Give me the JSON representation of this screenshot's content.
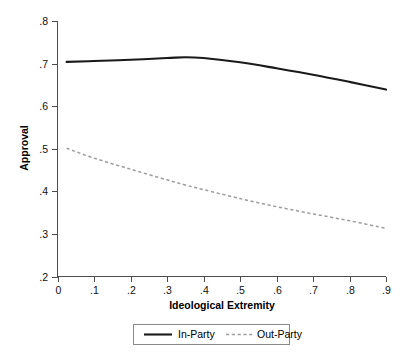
{
  "chart_data": {
    "type": "line",
    "title": "",
    "xlabel": "Ideological Extremity",
    "ylabel": "Approval",
    "xlim": [
      0,
      0.9
    ],
    "ylim": [
      0.2,
      0.8
    ],
    "grid": false,
    "legend_position": "bottom-center",
    "xticks": [
      "0",
      ".1",
      ".2",
      ".3",
      ".4",
      ".5",
      ".6",
      ".7",
      ".8",
      ".9"
    ],
    "xtick_values": [
      0,
      0.1,
      0.2,
      0.3,
      0.4,
      0.5,
      0.6,
      0.7,
      0.8,
      0.9
    ],
    "yticks": [
      ".2",
      ".3",
      ".4",
      ".5",
      ".6",
      ".7",
      ".8"
    ],
    "ytick_values": [
      0.2,
      0.3,
      0.4,
      0.5,
      0.6,
      0.7,
      0.8
    ],
    "x": [
      0.025,
      0.1,
      0.2,
      0.3,
      0.35,
      0.4,
      0.5,
      0.6,
      0.7,
      0.8,
      0.9
    ],
    "series": [
      {
        "name": "In-Party",
        "style": "solid",
        "color": "#1a1a1a",
        "values": [
          0.704,
          0.706,
          0.709,
          0.713,
          0.715,
          0.713,
          0.703,
          0.689,
          0.674,
          0.657,
          0.639
        ]
      },
      {
        "name": "Out-Party",
        "style": "dashed",
        "color": "#9e9e9e",
        "values": [
          0.501,
          0.478,
          0.452,
          0.427,
          0.415,
          0.404,
          0.383,
          0.364,
          0.347,
          0.331,
          0.313
        ]
      }
    ]
  },
  "legend": {
    "entries": [
      {
        "label": "In-Party"
      },
      {
        "label": "Out-Party"
      }
    ]
  }
}
